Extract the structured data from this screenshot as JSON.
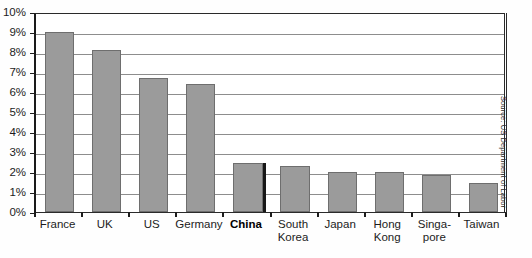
{
  "chart_data": {
    "type": "bar",
    "title": "",
    "title_visible_fragment": "",
    "xlabel": "",
    "ylabel": "",
    "ylim": [
      0,
      10
    ],
    "ytick_labels": [
      "0%",
      "1%",
      "2%",
      "3%",
      "4%",
      "5%",
      "6%",
      "7%",
      "8%",
      "9%",
      "10%"
    ],
    "ytick_values": [
      0,
      1,
      2,
      3,
      4,
      5,
      6,
      7,
      8,
      9,
      10
    ],
    "grid": true,
    "grid_axis": "y",
    "legend": "none",
    "categories": [
      "France",
      "UK",
      "US",
      "Germany",
      "China",
      "South Korea",
      "Japan",
      "Hong Kong",
      "Singa-\npore",
      "Taiwan"
    ],
    "values": [
      9.0,
      8.1,
      6.7,
      6.4,
      2.45,
      2.3,
      2.0,
      2.0,
      1.85,
      1.45
    ],
    "value_labels": [
      "9.0%",
      "8.1%",
      "6.7%",
      "6.4%",
      "2.45%",
      "2.3%",
      "2.0%",
      "2.0%",
      "1.85%",
      "1.45%"
    ],
    "highlighted_category": "China",
    "annotations": [
      "Source: US Department of Labor"
    ],
    "unit": "percent"
  },
  "source_note": "Source: US Department of Labor",
  "colors": {
    "bar_fill": "#9b9b9b",
    "bar_stroke": "#6e6e6e",
    "highlight_edge": "#171717",
    "axis": "#1c1c1c",
    "gridline": "#8d8d8d",
    "background": "#ffffff",
    "text": "#1c1c1c"
  }
}
